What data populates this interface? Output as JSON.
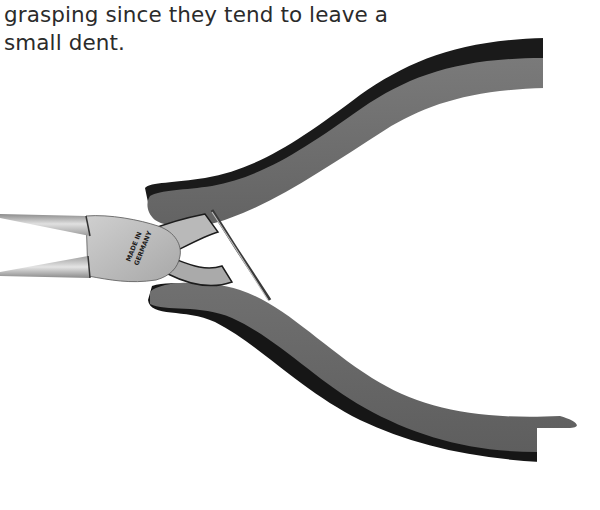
{
  "caption": {
    "lines": [
      "they are not recommended for general",
      "grasping since they tend to leave a",
      "small dent."
    ]
  },
  "figure": {
    "stamp_text": [
      "MADE IN",
      "GERMANY"
    ],
    "colors": {
      "handle_fill": "#6e6e6e",
      "handle_shadow": "#141414",
      "steel_light": "#d2d2d2",
      "steel_mid": "#a6a6a6",
      "steel_dark": "#4a4a4a",
      "text": "#2b2b2b",
      "background": "#ffffff"
    }
  }
}
